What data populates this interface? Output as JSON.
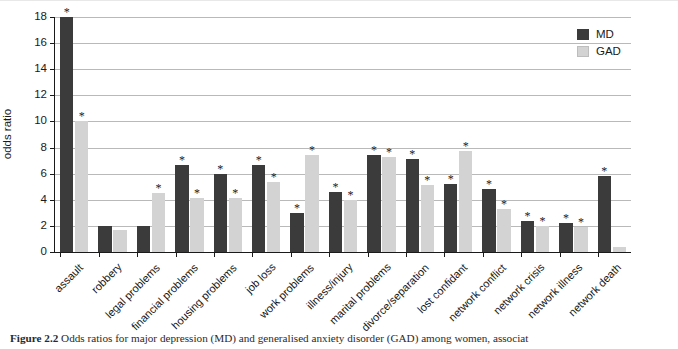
{
  "figure": {
    "caption_bold": "Figure 2.2",
    "caption_text": " Odds ratios for major depression (MD) and generalised anxiety disorder (GAD) among women, associat"
  },
  "legend": {
    "position": "top-right",
    "items": [
      {
        "label": "MD",
        "color": "#3b3b3b",
        "swatch": "legend-swatch-md"
      },
      {
        "label": "GAD",
        "color": "#d3d3d3",
        "swatch": "legend-swatch-gad"
      }
    ]
  },
  "axes": {
    "ylabel": "odds ratio",
    "yticks": [
      0,
      2,
      4,
      6,
      8,
      10,
      12,
      14,
      16,
      18
    ],
    "ytick_labels": [
      "0",
      "2",
      "4",
      "6",
      "8",
      "10",
      "12",
      "14",
      "16",
      "18"
    ],
    "ylim": [
      0,
      18
    ],
    "grid": "horizontal",
    "xlabel": ""
  },
  "significance_marker": "*",
  "chart_data": {
    "type": "bar",
    "title": "",
    "xlabel": "",
    "ylabel": "odds ratio",
    "ylim": [
      0,
      18
    ],
    "grid": true,
    "legend_position": "top-right",
    "categories": [
      "assault",
      "robbery",
      "legal problems",
      "financial problems",
      "housing problems",
      "job loss",
      "work problems",
      "illness/injury",
      "marital problems",
      "divorce/separation",
      "lost confidant",
      "network conflict",
      "network crisis",
      "network illness",
      "network death"
    ],
    "series": [
      {
        "name": "MD",
        "color": "#3b3b3b",
        "values": [
          18.0,
          2.0,
          2.0,
          6.7,
          6.0,
          6.7,
          3.0,
          4.6,
          7.4,
          7.1,
          5.2,
          4.8,
          2.4,
          2.2,
          5.8
        ],
        "significant": [
          true,
          false,
          false,
          true,
          true,
          true,
          true,
          true,
          true,
          true,
          true,
          true,
          true,
          true,
          true
        ]
      },
      {
        "name": "GAD",
        "color": "#d3d3d3",
        "values": [
          10.0,
          1.7,
          4.5,
          4.1,
          4.1,
          5.4,
          7.4,
          4.0,
          7.3,
          5.1,
          7.7,
          3.3,
          2.0,
          1.9,
          0.4
        ],
        "significant": [
          true,
          false,
          true,
          true,
          true,
          true,
          true,
          true,
          true,
          true,
          true,
          true,
          true,
          true,
          false
        ]
      }
    ]
  }
}
